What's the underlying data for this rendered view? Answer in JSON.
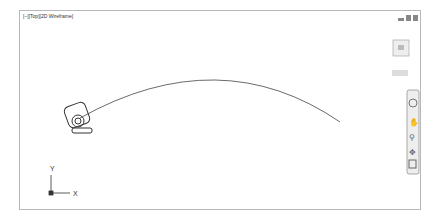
{
  "viewport": {
    "label": "[−][Top][2D Wireframe]"
  },
  "viewcube": {
    "top": "TOP",
    "n": "N",
    "s": "S",
    "e": "E",
    "w": "W",
    "wcs": "WCS ▾"
  },
  "ucs": {
    "x": "X",
    "y": "Y"
  },
  "navbar": {
    "tools": [
      "steering-wheel",
      "pan",
      "zoom",
      "orbit",
      "showmotion"
    ]
  }
}
